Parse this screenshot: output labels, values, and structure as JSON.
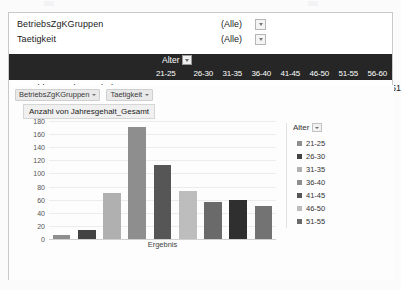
{
  "filters": {
    "rows": [
      {
        "label": "BetriebsZgKGruppen",
        "value": "(Alle)",
        "icon": "chevron-down-icon"
      },
      {
        "label": "Taetigkeit",
        "value": "(Alle)",
        "icon": "chevron-down-icon"
      }
    ]
  },
  "pivot": {
    "column_field": "Alter",
    "row_label": "Anzahl von Jahresgehalt_Gesamt",
    "columns": [
      "21-25",
      "26-30",
      "31-35",
      "36-40",
      "41-45",
      "46-50",
      "51-55",
      "56-60",
      "61-65"
    ],
    "values": [
      "6",
      "13",
      "70",
      "171",
      "113",
      "73",
      "57",
      "60",
      "51"
    ]
  },
  "chart_panel": {
    "field_buttons": [
      {
        "label": "BetriebsZgKGruppen"
      },
      {
        "label": "Taetigkeit"
      }
    ],
    "title_button": "Anzahl von Jahresgehalt_Gesamt",
    "legend_title": "Alter"
  },
  "chart_data": {
    "type": "bar",
    "title": "Anzahl von Jahresgehalt_Gesamt",
    "xlabel": "Ergebnis",
    "ylabel": "",
    "categories": [
      "21-25",
      "26-30",
      "31-35",
      "36-40",
      "41-45",
      "46-50",
      "51-55",
      "56-60",
      "61-65"
    ],
    "values": [
      6,
      13,
      70,
      171,
      113,
      73,
      57,
      60,
      51
    ],
    "ylim": [
      0,
      180
    ],
    "yticks": [
      180,
      160,
      140,
      120,
      100,
      80,
      60,
      40,
      20,
      0
    ],
    "grid": true,
    "legend_position": "right",
    "legend_entries": [
      "21-25",
      "26-30",
      "31-35",
      "36-40",
      "41-45",
      "46-50",
      "51-55"
    ],
    "bar_colors": [
      "#8e8e8e",
      "#434343",
      "#b0b0b0",
      "#8e8e8e",
      "#565656",
      "#bdbdbd",
      "#6a6a6a",
      "#2f2f2f",
      "#737373"
    ],
    "legend_colors": [
      "#8e8e8e",
      "#434343",
      "#b0b0b0",
      "#8e8e8e",
      "#565656",
      "#bdbdbd",
      "#6a6a6a"
    ]
  }
}
